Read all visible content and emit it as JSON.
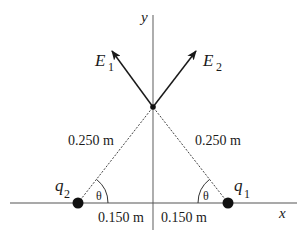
{
  "diagram": {
    "axes": {
      "x_label": "x",
      "y_label": "y"
    },
    "vectors": [
      {
        "name": "E",
        "subscript": "1"
      },
      {
        "name": "E",
        "subscript": "2"
      }
    ],
    "charges": [
      {
        "name": "q",
        "subscript": "1",
        "position": "right"
      },
      {
        "name": "q",
        "subscript": "2",
        "position": "left"
      }
    ],
    "distances": {
      "left_hyp": "0.250 m",
      "right_hyp": "0.250 m",
      "left_base": "0.150 m",
      "right_base": "0.150 m"
    },
    "angles": {
      "left": "θ",
      "right": "θ"
    },
    "colors": {
      "line": "#1a1a1a",
      "axis": "#555555",
      "dashed": "#444444"
    }
  }
}
